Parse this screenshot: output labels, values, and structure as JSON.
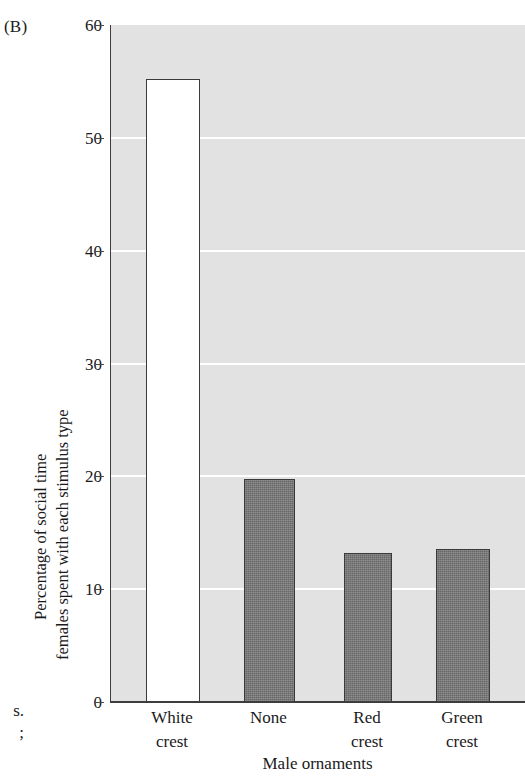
{
  "panel": {
    "label": "(B)"
  },
  "caption_bleed": {
    "line1": "s.",
    "line2": ";"
  },
  "chart_data": {
    "type": "bar",
    "title": "",
    "subtitle": "",
    "panel_label": "(B)",
    "xlabel": "Male ornaments",
    "ylabel": "Percentage of social time females spent with each stimulus type",
    "ylabel_lines": [
      "Percentage of social time",
      "females spent with each stimulus type"
    ],
    "categories": [
      "White crest",
      "None",
      "Red crest",
      "Green crest"
    ],
    "category_lines": [
      [
        "White",
        "crest"
      ],
      [
        "None"
      ],
      [
        "Red",
        "crest"
      ],
      [
        "Green",
        "crest"
      ]
    ],
    "values": [
      55.2,
      19.8,
      13.2,
      13.6
    ],
    "ylim": [
      0,
      60
    ],
    "yticks": [
      0,
      10,
      20,
      30,
      40,
      50,
      60
    ],
    "ytick_labels": [
      "0",
      "10",
      "20",
      "30",
      "40",
      "50",
      "60"
    ],
    "grid": true,
    "gridlines_at": [
      10,
      20,
      30,
      40,
      50
    ],
    "legend": "none",
    "bar_colors": [
      "#ffffff",
      "#747474",
      "#747474",
      "#747474"
    ],
    "plot_background": "#e2e2e2",
    "gridline_color": "#ffffff",
    "axis_color": "#3d3d3d",
    "bar_edge_color": "#3a3a3a"
  }
}
